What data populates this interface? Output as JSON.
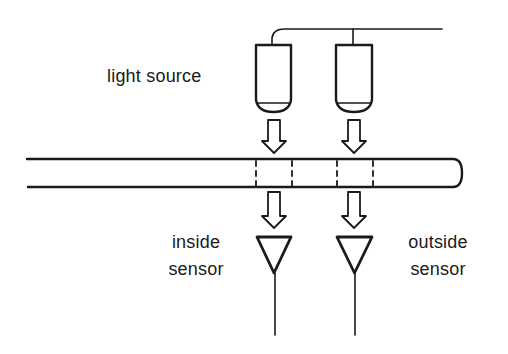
{
  "diagram": {
    "type": "optical-sensor-schematic",
    "labels": {
      "light_source": "light source",
      "inside_sensor": [
        "inside",
        "sensor"
      ],
      "outside_sensor": [
        "outside",
        "sensor"
      ]
    },
    "components": {
      "light_sources": [
        {
          "id": "lamp-inside",
          "x": 256,
          "y": 45,
          "width": 35
        },
        {
          "id": "lamp-outside",
          "x": 336,
          "y": 45,
          "width": 36
        }
      ],
      "tube": {
        "x1": 27,
        "x2": 460,
        "y_top": 159,
        "y_bottom": 187
      },
      "measurement_windows": [
        {
          "id": "window-inside",
          "x1": 256,
          "x2": 292
        },
        {
          "id": "window-outside",
          "x1": 337,
          "x2": 373
        }
      ],
      "sensors": [
        {
          "id": "sensor-inside",
          "cx": 274
        },
        {
          "id": "sensor-outside",
          "cx": 354
        }
      ]
    },
    "colors": {
      "stroke": "#1a1a1a",
      "background": "#ffffff"
    }
  }
}
